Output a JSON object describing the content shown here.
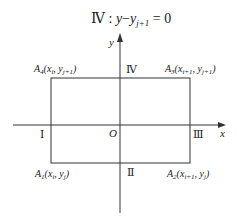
{
  "title": {
    "region": "Ⅳ",
    "sep": " : ",
    "y": "y",
    "minus": "−",
    "yj": "y",
    "sub": "j+1",
    "eq": " = 0"
  },
  "axes": {
    "x_label": "x",
    "y_label": "y",
    "origin_label": "O"
  },
  "regions": {
    "I": "Ⅰ",
    "II": "Ⅱ",
    "III": "Ⅲ",
    "IV": "Ⅳ"
  },
  "vertices": {
    "A1": {
      "name": "A",
      "idx": "1",
      "x": "x",
      "xs": "i",
      "y": "y",
      "ys": "j"
    },
    "A2": {
      "name": "A",
      "idx": "2",
      "x": "x",
      "xs": "i+1",
      "y": "y",
      "ys": "j"
    },
    "A3": {
      "name": "A",
      "idx": "3",
      "x": "x",
      "xs": "i+1",
      "y": "y",
      "ys": "j+1"
    },
    "A4": {
      "name": "A",
      "idx": "4",
      "x": "x",
      "xs": "i",
      "y": "y",
      "ys": "j+1"
    }
  }
}
